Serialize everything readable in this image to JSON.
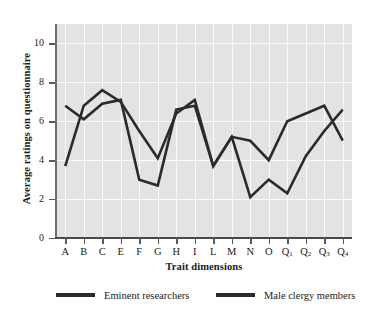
{
  "chart_data": {
    "type": "line",
    "title": "",
    "xlabel": "Trait dimensions",
    "ylabel": "Average ratings on questionnaire",
    "categories": [
      "A",
      "B",
      "C",
      "E",
      "F",
      "G",
      "H",
      "I",
      "L",
      "M",
      "N",
      "O",
      "Q1",
      "Q2",
      "Q3",
      "Q4"
    ],
    "category_labels_html": [
      "A",
      "B",
      "C",
      "E",
      "F",
      "G",
      "H",
      "I",
      "L",
      "M",
      "N",
      "O",
      "Q<sub>1</sub>",
      "Q<sub>2</sub>",
      "Q<sub>3</sub>",
      "Q<sub>4</sub>"
    ],
    "ylim": [
      0,
      11
    ],
    "yticks": [
      0,
      2,
      4,
      6,
      8,
      10
    ],
    "ytick_labels": [
      "0",
      "2",
      "4",
      "6",
      "8",
      "10"
    ],
    "grid": true,
    "legend_position": "bottom",
    "series": [
      {
        "name": "Eminent researchers",
        "color": "#2b2b2b",
        "values": [
          6.8,
          6.1,
          6.9,
          7.1,
          3.0,
          2.7,
          6.6,
          6.8,
          3.7,
          5.2,
          2.1,
          3.0,
          2.3,
          4.2,
          5.5,
          6.6
        ]
      },
      {
        "name": "Male clergy members",
        "color": "#2b2b2b",
        "values": [
          3.7,
          6.8,
          7.6,
          7.0,
          5.5,
          4.1,
          6.4,
          7.1,
          3.7,
          5.2,
          5.0,
          4.0,
          6.0,
          6.4,
          6.8,
          5.0
        ]
      }
    ]
  },
  "axes": {
    "y_title": "Average ratings on questionnaire",
    "x_title": "Trait dimensions"
  },
  "legend": {
    "entries": [
      {
        "label": "Eminent researchers"
      },
      {
        "label": "Male clergy members"
      }
    ]
  },
  "colors": {
    "plot_background": "#e3e3e3",
    "grid": "#fbfbfb",
    "line": "#2b2b2b",
    "axis": "#5a5a5a",
    "page_background": "#ffffff"
  }
}
